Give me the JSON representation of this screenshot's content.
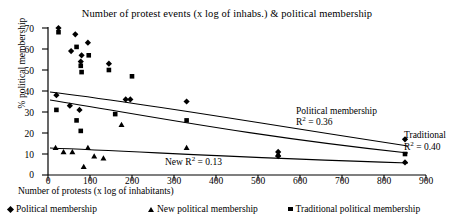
{
  "chart_data": {
    "type": "scatter",
    "title": "Number of protest events (x log of inhabs.) & political membership",
    "xlabel": "Number of protests (x log of inhabitants)",
    "ylabel": "% political membership",
    "xlim": [
      0,
      900
    ],
    "ylim": [
      0,
      70
    ],
    "xticks": [
      0,
      100,
      200,
      300,
      400,
      500,
      600,
      700,
      800,
      900
    ],
    "yticks": [
      0,
      10,
      20,
      30,
      40,
      50,
      60,
      70
    ],
    "grid": false,
    "legend_position": "bottom",
    "series": [
      {
        "name": "Political membership",
        "marker": "diamond",
        "points": [
          [
            25,
            70
          ],
          [
            65,
            67
          ],
          [
            95,
            63
          ],
          [
            55,
            59
          ],
          [
            80,
            57
          ],
          [
            78,
            54
          ],
          [
            145,
            53
          ],
          [
            20,
            38
          ],
          [
            52,
            33
          ],
          [
            75,
            31
          ],
          [
            185,
            36
          ],
          [
            196,
            36
          ],
          [
            330,
            35
          ],
          [
            548,
            11
          ],
          [
            548,
            9
          ],
          [
            850,
            17
          ],
          [
            850,
            6
          ]
        ]
      },
      {
        "name": "New political membership",
        "marker": "triangle",
        "points": [
          [
            18,
            13
          ],
          [
            37,
            11
          ],
          [
            58,
            11
          ],
          [
            95,
            13
          ],
          [
            110,
            9
          ],
          [
            132,
            8
          ],
          [
            85,
            4
          ],
          [
            175,
            24
          ],
          [
            330,
            13
          ],
          [
            548,
            10
          ]
        ]
      },
      {
        "name": "Traditional political membership",
        "marker": "square",
        "points": [
          [
            25,
            68
          ],
          [
            68,
            61
          ],
          [
            97,
            57
          ],
          [
            78,
            52
          ],
          [
            80,
            49
          ],
          [
            145,
            50
          ],
          [
            20,
            31
          ],
          [
            68,
            26
          ],
          [
            78,
            21
          ],
          [
            160,
            29
          ],
          [
            200,
            47
          ],
          [
            330,
            26
          ],
          [
            850,
            10
          ]
        ]
      }
    ],
    "trendlines": [
      {
        "name": "Political membership",
        "r2_label": "R² = 0.36",
        "annotation": "Political membership",
        "r2": 0.36
      },
      {
        "name": "Traditional political membership",
        "r2_label": "R² = 0.40",
        "annotation": "Traditional",
        "r2": 0.4
      },
      {
        "name": "New political membership",
        "r2_label": "R² = 0.13",
        "annotation": "New",
        "r2": 0.13
      }
    ]
  },
  "annotations": {
    "political_name": "Political membership",
    "political_r2_prefix": "R",
    "political_r2_value": " = 0.36",
    "traditional_name": "Traditional",
    "traditional_r2_value": " = 0.40",
    "new_prefix": "New R",
    "new_r2_value": " = 0.13",
    "superscript": "2"
  },
  "legend": {
    "items": [
      {
        "marker": "diamond",
        "label": "Political membership"
      },
      {
        "marker": "triangle",
        "label": "New political membership"
      },
      {
        "marker": "square",
        "label": "Traditional political membership"
      }
    ]
  },
  "axis": {
    "y_labels": [
      "70",
      "60",
      "50",
      "40",
      "30",
      "20",
      "10",
      "0"
    ],
    "x_labels": [
      "0",
      "100",
      "200",
      "300",
      "400",
      "500",
      "600",
      "700",
      "800",
      "900"
    ]
  },
  "colors": {
    "ink": "#000000",
    "background": "#ffffff"
  }
}
